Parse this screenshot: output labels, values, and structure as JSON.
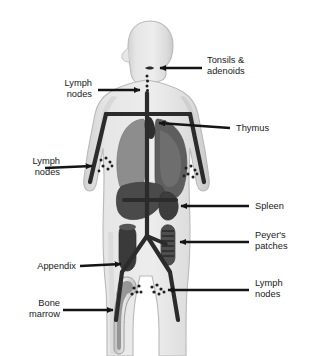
{
  "figure": {
    "colors": {
      "background": "#ffffff",
      "body_fill": "#e3e3e3",
      "body_shade": "#cfcfcf",
      "body_outline": "#b5b5b5",
      "vessel": "#2b2b2b",
      "node_dot": "#1f1f1f",
      "lung_left": "#8d8d8d",
      "lung_right": "#5e5e5e",
      "liver": "#4a4a4a",
      "spleen": "#3d3d3d",
      "thymus": "#2e2e2e",
      "appendix": "#3a3a3a",
      "peyers": "#4f4f4f",
      "bone": "#d8d8d8",
      "marrow": "#8a8a8a",
      "label_text": "#1a1a1a",
      "leader_line": "#141414"
    }
  },
  "labels": [
    {
      "id": "tonsils-adenoids",
      "text": "Tonsils &\nadenoids",
      "side": "right",
      "arrow": true
    },
    {
      "id": "lymph-nodes-cervical",
      "text": "Lymph\nnodes",
      "side": "left",
      "arrow": true
    },
    {
      "id": "thymus",
      "text": "Thymus",
      "side": "right",
      "arrow": true
    },
    {
      "id": "lymph-nodes-axillary",
      "text": "Lymph\nnodes",
      "side": "left",
      "arrow": true
    },
    {
      "id": "spleen",
      "text": "Spleen",
      "side": "right",
      "arrow": true
    },
    {
      "id": "peyers-patches",
      "text": "Peyer's\npatches",
      "side": "right",
      "arrow": true
    },
    {
      "id": "appendix",
      "text": "Appendix",
      "side": "left",
      "arrow": true
    },
    {
      "id": "lymph-nodes-inguinal",
      "text": "Lymph\nnodes",
      "side": "right",
      "arrow": true
    },
    {
      "id": "bone-marrow",
      "text": "Bone\nmarrow",
      "side": "left",
      "arrow": true
    }
  ],
  "structures": [
    {
      "id": "tonsils",
      "name": "Tonsils and adenoids"
    },
    {
      "id": "cervical-nodes",
      "name": "Cervical lymph nodes"
    },
    {
      "id": "thymus-organ",
      "name": "Thymus"
    },
    {
      "id": "lung-left",
      "name": "Left lung"
    },
    {
      "id": "lung-right",
      "name": "Right lung"
    },
    {
      "id": "liver",
      "name": "Liver"
    },
    {
      "id": "spleen-organ",
      "name": "Spleen"
    },
    {
      "id": "axillary-nodes",
      "name": "Axillary lymph nodes"
    },
    {
      "id": "appendix-organ",
      "name": "Appendix"
    },
    {
      "id": "peyers-patches-organ",
      "name": "Peyer's patches"
    },
    {
      "id": "inguinal-nodes",
      "name": "Inguinal lymph nodes"
    },
    {
      "id": "femur-bone-marrow",
      "name": "Femur with bone marrow"
    },
    {
      "id": "thoracic-duct",
      "name": "Lymphatic vessels"
    }
  ]
}
